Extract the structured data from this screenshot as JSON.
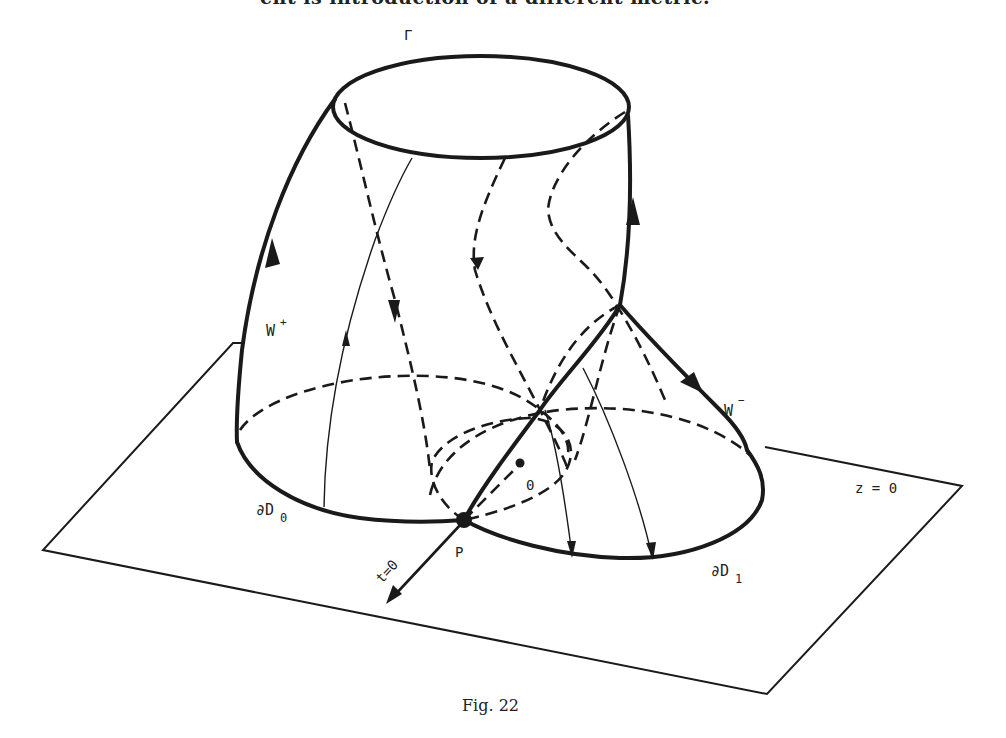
{
  "page": {
    "header_fragment": "ent is introduction of a different metric.",
    "caption": "Fig. 22"
  },
  "figure": {
    "type": "3d-surface-diagram",
    "labels": {
      "gamma": "Γ",
      "w_plus": "W",
      "w_plus_sup": "+",
      "w_minus": "W",
      "w_minus_sup": "−",
      "dD0": "∂D",
      "dD0_sub": "0",
      "dD1": "∂D",
      "dD1_sub": "1",
      "P": "P",
      "O": "0",
      "t0": "t=0",
      "z0": "z  =  0"
    },
    "elements": [
      "plane z=0",
      "top ellipse Γ",
      "cylinder surface W+ with flow lines",
      "surface W- descending to ∂D1",
      "disk boundary ∂D0",
      "disk boundary ∂D1",
      "point P",
      "point O",
      "axis t=0"
    ]
  }
}
